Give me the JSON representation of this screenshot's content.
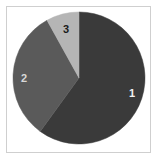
{
  "figure": {
    "background_color": "#ffffff",
    "frame_border_color": "#cfcfcf"
  },
  "chart_data": {
    "type": "pie",
    "title": "",
    "subtitle": "",
    "xlabel": "",
    "ylabel": "",
    "grid": false,
    "legend_position": "none",
    "labels_position": "inside-slices",
    "start_angle_deg": 0,
    "direction": "clockwise",
    "categories": [
      "1",
      "2",
      "3"
    ],
    "values": [
      60,
      32,
      8
    ],
    "units": "percent",
    "slices": [
      {
        "label": "1",
        "value": 60,
        "percent": 60,
        "start_angle_deg": 0,
        "end_angle_deg": 216,
        "color": "#3a3a3a",
        "label_color": "#f2f2f2"
      },
      {
        "label": "2",
        "value": 32,
        "percent": 32,
        "start_angle_deg": 216,
        "end_angle_deg": 331,
        "color": "#5a5a5a",
        "label_color": "#d8d8d8"
      },
      {
        "label": "3",
        "value": 8,
        "percent": 8,
        "start_angle_deg": 331,
        "end_angle_deg": 360,
        "color": "#b5b5b5",
        "label_color": "#1a1a1a"
      }
    ],
    "geometry": {
      "center_x": 79,
      "center_y": 78,
      "radius": 66
    }
  }
}
